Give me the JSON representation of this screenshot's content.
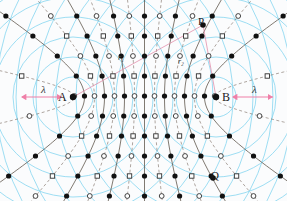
{
  "figure": {
    "type": "wave-interference-diagram",
    "background_color": "#fbfcfd",
    "width": 287,
    "height": 201
  },
  "sources": [
    {
      "id": "A",
      "label": "A",
      "x": 73,
      "y": 97,
      "label_x": 58,
      "label_y": 91
    },
    {
      "id": "B",
      "label": "B",
      "x": 216,
      "y": 97,
      "label_x": 222,
      "label_y": 91
    }
  ],
  "points": [
    {
      "id": "P",
      "label": "P",
      "x": 203,
      "y": 25,
      "label_x": 198,
      "label_y": 16
    },
    {
      "id": "Q",
      "label": "Q",
      "x": 213,
      "y": 178,
      "label_x": 211,
      "label_y": 170
    }
  ],
  "rays": [
    {
      "id": "r1",
      "label": "r₁",
      "from": "A",
      "to": "P",
      "label_x": 118,
      "label_y": 54
    },
    {
      "id": "r2",
      "label": "r₂",
      "from": "B",
      "to": "P",
      "label_x": 178,
      "label_y": 58
    }
  ],
  "wavelength_markers": [
    {
      "id": "lambda-left",
      "label": "λ",
      "label_x": 41,
      "label_y": 84,
      "arrow_x1": 22,
      "arrow_x2": 62,
      "arrow_y": 97
    },
    {
      "id": "lambda-right",
      "label": "λ",
      "label_x": 252,
      "label_y": 84,
      "arrow_x1": 233,
      "arrow_x2": 273,
      "arrow_y": 97
    }
  ],
  "colors": {
    "wavefront_circles": "#7fd4ef",
    "hyperbola_lines": "#5a5046",
    "nodal_dashed": "#7a6a60",
    "antinode_dot_fill": "#111111",
    "node_marker_stroke": "#2f2f2f",
    "node_marker_fill": "#ffffff",
    "ray_line": "#e08aa8",
    "lambda_arrow": "#ef7fa8",
    "label_text": "#1a1a1a",
    "background": "#fbfcfd"
  },
  "geometry": {
    "center_x": 144.5,
    "center_y": 97,
    "half_separation": 71.5,
    "wavelength_px": 40,
    "circle_spacing_px": 20,
    "marker_spacing_px": 20
  },
  "markers": {
    "antinode_name": "antinode-dot",
    "node_circle_name": "node-open-circle",
    "node_square_name": "node-open-square"
  }
}
